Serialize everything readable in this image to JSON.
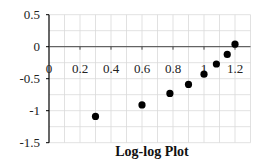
{
  "chart_data": {
    "type": "scatter",
    "title": "Log-log Plot",
    "xlabel": "",
    "ylabel": "",
    "xlim": [
      0,
      1.3
    ],
    "ylim": [
      -1.5,
      0.5
    ],
    "x_ticks": [
      0,
      0.2,
      0.4,
      0.6,
      0.8,
      1,
      1.2
    ],
    "x_tick_labels": [
      "0",
      "0.2",
      "0.4",
      "0.6",
      "0.8",
      "1",
      "1.2"
    ],
    "y_ticks": [
      0.5,
      0,
      -0.5,
      -1,
      -1.5
    ],
    "y_tick_labels": [
      "0.5",
      "0",
      "-0.5",
      "-1",
      "-1.5"
    ],
    "grid": true,
    "legend": null,
    "series": [
      {
        "name": "data",
        "marker": "circle",
        "color": "#000000",
        "x": [
          0.3,
          0.6,
          0.78,
          0.9,
          1.0,
          1.08,
          1.15,
          1.2
        ],
        "y": [
          -1.09,
          -0.91,
          -0.73,
          -0.59,
          -0.43,
          -0.27,
          -0.12,
          0.04
        ]
      }
    ]
  },
  "colors": {
    "grid": "#d9d9d9",
    "axis": "#000000",
    "marker": "#000000"
  }
}
